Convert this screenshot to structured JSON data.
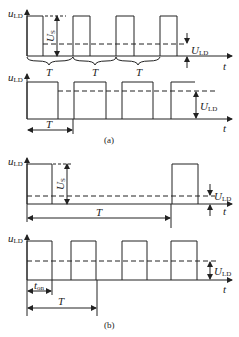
{
  "diagram": {
    "type": "waveform",
    "colors": {
      "stroke": "#222222",
      "background": "#ffffff"
    },
    "panels": [
      {
        "id": "a-top",
        "ylabel": "u",
        "ylabel_sub": "LD",
        "xlabel": "t",
        "amplitude_label": "U",
        "amplitude_sub": "S",
        "avg_label": "U",
        "avg_sub": "LD",
        "period_labels": [
          "T",
          "T",
          "T"
        ]
      },
      {
        "id": "a-bottom",
        "ylabel": "u",
        "ylabel_sub": "LD",
        "xlabel": "t",
        "avg_label": "U",
        "avg_sub": "LD",
        "period_label": "T"
      },
      {
        "id": "b-top",
        "ylabel": "u",
        "ylabel_sub": "LD",
        "xlabel": "t",
        "amplitude_label": "U",
        "amplitude_sub": "S",
        "avg_label": "U",
        "avg_sub": "LD",
        "period_label": "T"
      },
      {
        "id": "b-bottom",
        "ylabel": "u",
        "ylabel_sub": "LD",
        "xlabel": "t",
        "avg_label": "U",
        "avg_sub": "LD",
        "on_label": "t",
        "on_sub": "on",
        "period_label": "T"
      }
    ],
    "captions": [
      "(a)",
      "(b)"
    ]
  }
}
